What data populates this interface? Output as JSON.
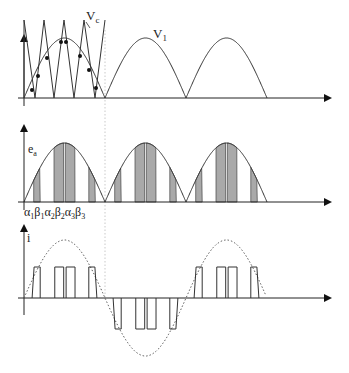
{
  "figure": {
    "panels": [
      {
        "id": "carrier",
        "labels": {
          "carrier": "V",
          "carrier_sub": "c",
          "reference": "V",
          "reference_sub": "1"
        }
      },
      {
        "id": "voltage",
        "labels": {
          "axis": "e",
          "axis_sub": "a"
        },
        "angle_labels": [
          {
            "sym": "α",
            "sub": "1"
          },
          {
            "sym": "β",
            "sub": "1"
          },
          {
            "sym": "α",
            "sub": "2"
          },
          {
            "sym": "β",
            "sub": "2"
          },
          {
            "sym": "α",
            "sub": "3"
          },
          {
            "sym": "β",
            "sub": "3"
          }
        ]
      },
      {
        "id": "current",
        "labels": {
          "axis": "i"
        }
      }
    ],
    "colors": {
      "line": "#333333",
      "fill": "#a9a9a9",
      "dotted": "#555555",
      "background": "#ffffff"
    }
  }
}
